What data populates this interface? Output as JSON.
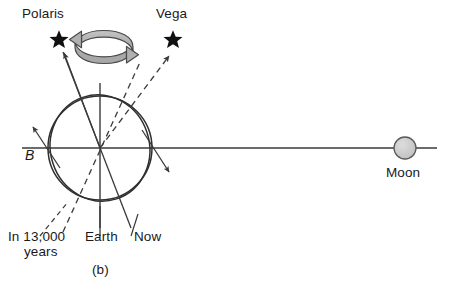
{
  "figure": {
    "panel_label": "(b)",
    "caption_labels": {
      "polaris": "Polaris",
      "vega": "Vega",
      "earth": "Earth",
      "now": "Now",
      "future_line1": "In 13,000",
      "future_line2": "years",
      "moon": "Moon",
      "tilt_marker": "B"
    },
    "colors": {
      "line": "#3a3a3a",
      "star_fill": "#111111",
      "moon_fill": "#c9c9c9",
      "moon_stroke": "#555555",
      "precession_fill": "#b3b3b3",
      "precession_stroke": "#4a4a4a",
      "text": "#1a1a1a",
      "background": "#ffffff"
    },
    "geometry": {
      "earth_center_x": 100,
      "earth_center_y": 148,
      "earth_radius": 52,
      "tilt_degrees": 23,
      "moon_center_x": 405,
      "moon_center_y": 148,
      "moon_radius": 11,
      "horizontal_line_x1": 22,
      "horizontal_line_x2": 437
    },
    "elements": {
      "polaris_star_x": 59,
      "polaris_star_y": 40,
      "vega_star_x": 173,
      "vega_star_y": 40,
      "now_axis_style": "solid",
      "future_axis_style": "dashed",
      "precession_arrow": "circular-double-arrow"
    }
  }
}
